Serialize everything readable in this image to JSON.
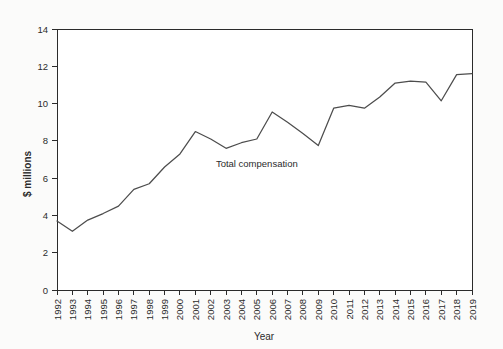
{
  "chart_data": {
    "type": "line",
    "title": "",
    "xlabel": "Year",
    "ylabel": "$ millions",
    "grid": false,
    "legend_position": "inline-annotation",
    "annotations": [
      {
        "text": "Total compensation",
        "x": 2005.0,
        "y": 6.6
      }
    ],
    "xlim": [
      1992,
      2019
    ],
    "ylim": [
      0,
      14
    ],
    "ytick_labels": [
      "0",
      "2",
      "4",
      "6",
      "8",
      "10",
      "12",
      "14"
    ],
    "yticks": [
      0,
      2,
      4,
      6,
      8,
      10,
      12,
      14
    ],
    "categories": [
      "1992",
      "1993",
      "1994",
      "1995",
      "1996",
      "1997",
      "1998",
      "1999",
      "2000",
      "2001",
      "2002",
      "2003",
      "2004",
      "2005",
      "2006",
      "2007",
      "2008",
      "2009",
      "2010",
      "2011",
      "2012",
      "2013",
      "2014",
      "2015",
      "2016",
      "2017",
      "2018",
      "2019"
    ],
    "series": [
      {
        "name": "Total compensation",
        "color": "#4d4d4d",
        "values": [
          3.7,
          3.15,
          3.75,
          4.1,
          4.5,
          5.4,
          5.7,
          6.6,
          7.3,
          8.5,
          8.1,
          7.6,
          7.9,
          8.1,
          9.55,
          9.0,
          8.4,
          7.75,
          9.75,
          9.9,
          9.75,
          10.35,
          11.1,
          11.2,
          11.15,
          10.15,
          11.55,
          11.6
        ]
      }
    ]
  },
  "colors": {
    "line": "#4d4d4d",
    "axis": "#2b2b2b",
    "text": "#2b2b2b",
    "background": "#fbfbfa",
    "plot_background": "#ffffff"
  }
}
